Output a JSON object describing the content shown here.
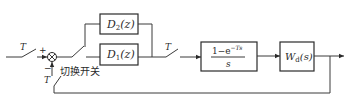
{
  "diagram": {
    "type": "block-diagram",
    "title": "",
    "input_sampler": {
      "label": "T"
    },
    "summing_junction": {
      "plus_sign": "+",
      "minus_sign": "−"
    },
    "feedback_sampler": {
      "label": "T"
    },
    "switch": {
      "label": "切换开关"
    },
    "controllers": [
      {
        "id": "D2",
        "name": "D",
        "subscript": "2",
        "arg": "(z)"
      },
      {
        "id": "D1",
        "name": "D",
        "subscript": "1",
        "arg": "(z)"
      }
    ],
    "output_sampler": {
      "label": "T"
    },
    "hold": {
      "numerator": "1−e",
      "exponent": "−Ts",
      "denominator": "s"
    },
    "plant": {
      "name": "W",
      "subscript": "d",
      "arg": "(s)"
    }
  }
}
